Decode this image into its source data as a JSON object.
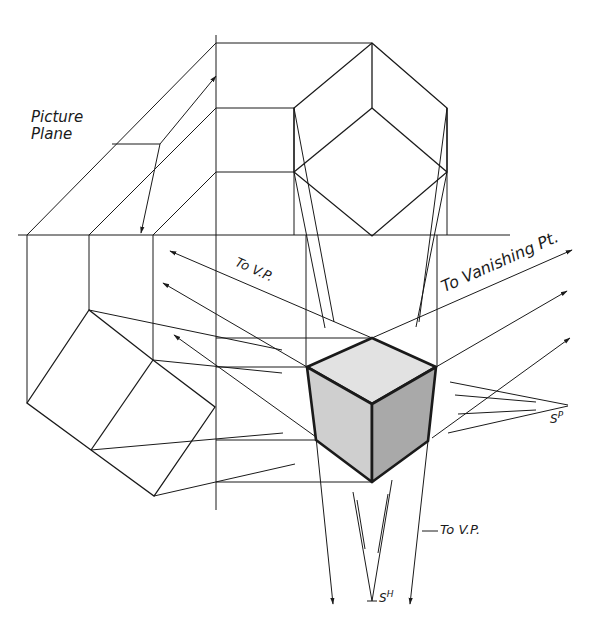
{
  "figure": {
    "labels": {
      "picture_plane_line1": "Picture",
      "picture_plane_line2": "Plane",
      "to_vp_upper": "To V.P.",
      "to_vanishing_pt": "To Vanishing Pt.",
      "to_vp_lower": "To V.P.",
      "station_point_plan": "S",
      "station_point_plan_sup": "P",
      "station_point_elev": "S",
      "station_point_elev_sup": "H"
    },
    "colors": {
      "ink": "#1a1a1a",
      "top_face": "#e2e2e2",
      "left_face": "#cfcfcf",
      "right_face": "#a9a9a9",
      "background": "#ffffff"
    },
    "views": [
      "top-view-cube",
      "side-elevation-cube",
      "perspective-cube"
    ]
  }
}
